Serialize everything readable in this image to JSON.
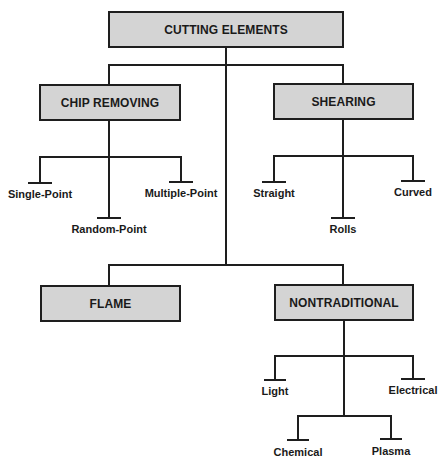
{
  "root": {
    "label": "CUTTING ELEMENTS"
  },
  "categories": [
    {
      "label": "CHIP REMOVING",
      "children": [
        "Single-Point",
        "Random-Point",
        "Multiple-Point"
      ]
    },
    {
      "label": "SHEARING",
      "children": [
        "Straight",
        "Rolls",
        "Curved"
      ]
    },
    {
      "label": "FLAME",
      "children": []
    },
    {
      "label": "NONTRADITIONAL",
      "children": [
        "Light",
        "Electrical",
        "Chemical",
        "Plasma"
      ]
    }
  ],
  "colors": {
    "box_fill": "#d4d4d4",
    "line": "#1e1e1e",
    "text": "#1a1a1a"
  }
}
